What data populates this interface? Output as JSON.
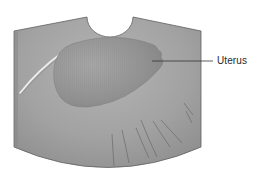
{
  "figure": {
    "type": "ultrasound-schematic",
    "labels": [
      {
        "text": "Uterus",
        "target": "uterus-region"
      }
    ]
  },
  "colors": {
    "background": "#ffffff",
    "field_fill": "#9c9c9c",
    "field_edge": "#5a5a5a",
    "uterus_fill": "#8e8e8e",
    "leader_line": "#333333",
    "label_text": "#2a2a2a"
  }
}
